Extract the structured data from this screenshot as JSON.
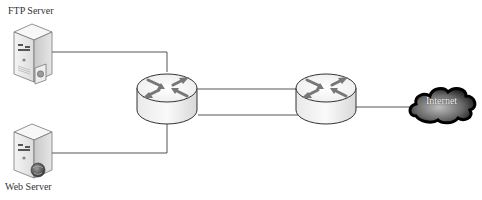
{
  "diagram": {
    "type": "network-topology",
    "background": "#ffffff",
    "line_color": "#555555",
    "nodes": [
      {
        "id": "ftp-server",
        "kind": "server",
        "label": "FTP Server",
        "badge": "lock"
      },
      {
        "id": "web-server",
        "kind": "server",
        "label": "Web Server",
        "badge": "globe"
      },
      {
        "id": "router-1",
        "kind": "router",
        "label": ""
      },
      {
        "id": "router-2",
        "kind": "router",
        "label": ""
      },
      {
        "id": "internet",
        "kind": "cloud",
        "label": "Internet"
      }
    ],
    "edges": [
      {
        "from": "ftp-server",
        "to": "router-1"
      },
      {
        "from": "web-server",
        "to": "router-1"
      },
      {
        "from": "router-1",
        "to": "router-2",
        "index": 1
      },
      {
        "from": "router-1",
        "to": "router-2",
        "index": 2
      },
      {
        "from": "router-2",
        "to": "internet"
      }
    ]
  },
  "labels": {
    "ftp": "FTP Server",
    "web": "Web Server",
    "internet": "Internet"
  }
}
